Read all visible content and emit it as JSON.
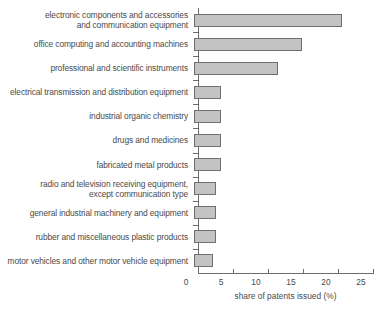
{
  "chart_data": {
    "type": "bar",
    "orientation": "horizontal",
    "title": "",
    "xlabel": "share of patents issued (%)",
    "ylabel": "",
    "xlim": [
      0,
      25
    ],
    "xticks": [
      0,
      5,
      10,
      15,
      20,
      25
    ],
    "grid": false,
    "legend": null,
    "bar_color": "#c3c3c3",
    "bar_edge_color": "#6f6f6f",
    "axis_color": "#6d6d6d",
    "text_color": "#4a4a4a",
    "categories": [
      "electronic components and accessories\nand communication equipment",
      "office computing and accounting machines",
      "professional and scientific instruments",
      "electrical transmission and distribution equipment",
      "industrial organic chemistry",
      "drugs and medicines",
      "fabricated metal products",
      "radio and television receiving equipment,\nexcept communication type",
      "general industrial machinery and equipment",
      "rubber and miscellaneous plastic products",
      "motor vehicles and other motor vehicle equipment"
    ],
    "values": [
      21.1,
      15.4,
      12.0,
      3.9,
      3.9,
      3.9,
      3.9,
      3.1,
      3.1,
      3.1,
      2.7
    ]
  }
}
